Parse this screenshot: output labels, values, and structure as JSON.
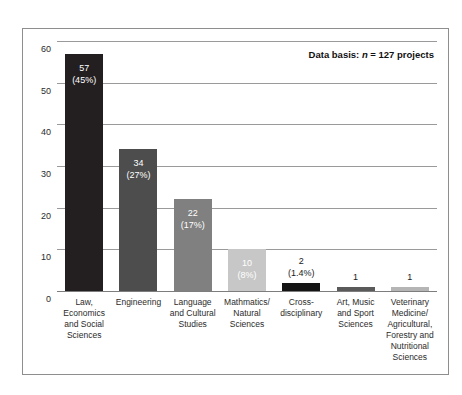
{
  "top_sliver_text": "",
  "annotation": {
    "prefix": "Data basis: ",
    "italic_symbol": "n",
    "suffix": " = 127 projects"
  },
  "axis": {
    "zero_label": "0",
    "ticks": [
      "60",
      "50",
      "40",
      "30",
      "20",
      "10",
      "0"
    ]
  },
  "chart_data": {
    "type": "bar",
    "title": "",
    "subtitle": "",
    "xlabel": "",
    "ylabel": "",
    "ylim": [
      0,
      60
    ],
    "yticks": [
      0,
      10,
      20,
      30,
      40,
      50,
      60
    ],
    "grid": true,
    "legend": false,
    "annotation": "Data basis: n = 127 projects",
    "total": 127,
    "categories": [
      "Law, Economics and Social Sciences",
      "Engineering",
      "Language and Cultural Studies",
      "Mathmatics/ Natural Sciences",
      "Cross-disciplinary",
      "Art, Music and Sport Sciences",
      "Veterinary Medicine/ Agricultural, Forestry and Nutritional Sciences"
    ],
    "category_lines": [
      [
        "Law,",
        "Economics",
        "and Social",
        "Sciences"
      ],
      [
        "Engineering"
      ],
      [
        "Language",
        "and Cultural",
        "Studies"
      ],
      [
        "Mathmatics/",
        "Natural",
        "Sciences"
      ],
      [
        "Cross-",
        "disciplinary"
      ],
      [
        "Art, Music",
        "and Sport",
        "Sciences"
      ],
      [
        "Veterinary",
        "Medicine/",
        "Agricultural,",
        "Forestry and",
        "Nutritional",
        "Sciences"
      ]
    ],
    "values": [
      57,
      34,
      22,
      10,
      2,
      1,
      1
    ],
    "percent_labels": [
      "(45%)",
      "(27%)",
      "(17%)",
      "(8%)",
      "(1.4%)",
      "",
      ""
    ],
    "value_labels": [
      "57",
      "34",
      "22",
      "10",
      "2",
      "1",
      "1"
    ],
    "bar_colors": [
      "#231f20",
      "#4d4d4d",
      "#808080",
      "#c7c7c7",
      "#141414",
      "#5a5a5a",
      "#b5b5b5"
    ],
    "label_inside": [
      true,
      true,
      true,
      true,
      false,
      false,
      false
    ],
    "bars": [
      {
        "label": "57",
        "pct": "(45%)",
        "value": 57,
        "color": "#231f20",
        "inside": true
      },
      {
        "label": "34",
        "pct": "(27%)",
        "value": 34,
        "color": "#4d4d4d",
        "inside": true
      },
      {
        "label": "22",
        "pct": "(17%)",
        "value": 22,
        "color": "#808080",
        "inside": true
      },
      {
        "label": "10",
        "pct": "(8%)",
        "value": 10,
        "color": "#c7c7c7",
        "inside": true
      },
      {
        "label": "2",
        "pct": "(1.4%)",
        "value": 2,
        "color": "#141414",
        "inside": false
      },
      {
        "label": "1",
        "pct": "",
        "value": 1,
        "color": "#5a5a5a",
        "inside": false
      },
      {
        "label": "1",
        "pct": "",
        "value": 1,
        "color": "#b5b5b5",
        "inside": false
      }
    ]
  }
}
